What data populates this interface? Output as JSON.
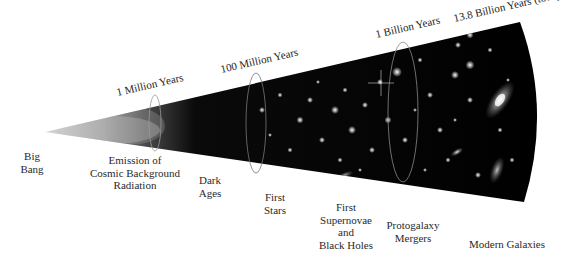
{
  "diagram": {
    "origin_label": [
      "Big",
      "Bang"
    ],
    "time_markers": [
      {
        "label": "1 Million Years"
      },
      {
        "label": "100 Million Years"
      },
      {
        "label": "1 Billion Years"
      },
      {
        "label": "13.8 Billion Years (today)"
      }
    ],
    "epochs": [
      {
        "lines": [
          "Emission of",
          "Cosmic Background",
          "Radiation"
        ]
      },
      {
        "lines": [
          "Dark",
          "Ages"
        ]
      },
      {
        "lines": [
          "First",
          "Stars"
        ]
      },
      {
        "lines": [
          "First",
          "Supernovae",
          "and",
          "Black Holes"
        ]
      },
      {
        "lines": [
          "Protogalaxy",
          "Mergers"
        ]
      },
      {
        "lines": [
          "Modern Galaxies"
        ]
      }
    ],
    "colors": {
      "background": "#ffffff",
      "space": "#000000",
      "cmb_glow": "#bdbdbd",
      "text": "#222222"
    }
  }
}
